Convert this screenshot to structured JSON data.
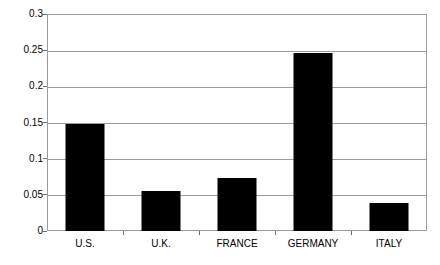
{
  "chart_data": {
    "type": "bar",
    "title": "",
    "subtitle": "",
    "xlabel": "",
    "ylabel": "",
    "categories": [
      "U.S.",
      "U.K.",
      "FRANCE",
      "GERMANY",
      "ITALY"
    ],
    "values": [
      0.148,
      0.055,
      0.073,
      0.246,
      0.039
    ],
    "series": [
      {
        "name": "",
        "values": [
          0.148,
          0.055,
          0.073,
          0.246,
          0.039
        ]
      }
    ],
    "ylim": [
      0,
      0.3
    ],
    "ytick_labels": [
      "0",
      "0.05",
      "0.1",
      "0.15",
      "0.2",
      "0.25",
      "0.3"
    ],
    "ytick_values": [
      0,
      0.05,
      0.1,
      0.15,
      0.2,
      0.25,
      0.3
    ],
    "grid": true,
    "grid_axis": "y",
    "legend": false,
    "legend_position": "none",
    "annotations": [],
    "colors": {
      "bar_fill": "#000000",
      "grid_line": "#9a9a9a",
      "plot_border": "#9a9a9a",
      "tick_mark": "#6d6d6d",
      "text": "#000000",
      "background": "#ffffff"
    }
  }
}
